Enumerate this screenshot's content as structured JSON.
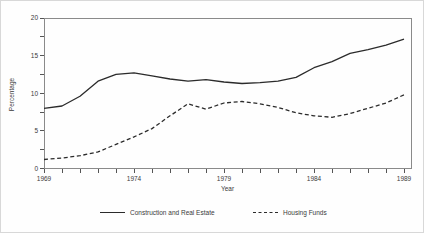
{
  "chart_data": {
    "type": "line",
    "title": "",
    "xlabel": "Year",
    "ylabel": "Percentage",
    "xlim": [
      1969,
      1989
    ],
    "ylim": [
      0,
      20
    ],
    "x_labeled_ticks": [
      1969,
      1974,
      1979,
      1984,
      1989
    ],
    "x_minor_step": 1,
    "y_labeled_ticks": [
      0,
      5,
      10,
      15,
      20
    ],
    "y_minor_step": 2.5,
    "grid": false,
    "legend_position": "bottom",
    "line_color": "#2b2b2b",
    "frame_color": "#8a8a8a",
    "x": [
      1969,
      1970,
      1971,
      1972,
      1973,
      1974,
      1975,
      1976,
      1977,
      1978,
      1979,
      1980,
      1981,
      1982,
      1983,
      1984,
      1985,
      1986,
      1987,
      1988,
      1989
    ],
    "series": [
      {
        "name": "Construction and Real Estate",
        "style": "solid",
        "values": [
          8.0,
          8.3,
          9.6,
          11.6,
          12.5,
          12.7,
          12.3,
          11.9,
          11.6,
          11.8,
          11.5,
          11.3,
          11.4,
          11.6,
          12.1,
          13.4,
          14.2,
          15.3,
          15.8,
          16.4,
          17.2
        ]
      },
      {
        "name": "Housing Funds",
        "style": "dashed",
        "values": [
          1.2,
          1.4,
          1.7,
          2.2,
          3.2,
          4.2,
          5.3,
          7.0,
          8.6,
          7.9,
          8.7,
          8.9,
          8.6,
          8.1,
          7.4,
          7.0,
          6.8,
          7.3,
          8.0,
          8.7,
          9.8
        ]
      }
    ]
  }
}
